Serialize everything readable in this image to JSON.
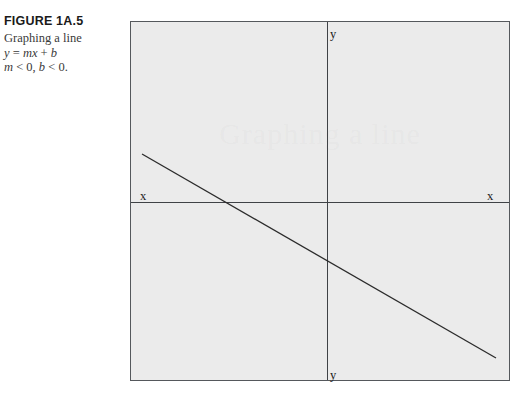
{
  "caption": {
    "figure_number": "FIGURE 1A.5",
    "description": "Graphing a line",
    "equation_prefix": "y",
    "equation_eq": " = ",
    "equation_m": "m",
    "equation_x": "x",
    "equation_plus": " + ",
    "equation_b": "b",
    "condition_m": "m",
    "condition_m_rest": " < 0, ",
    "condition_b": "b",
    "condition_b_rest": " < 0."
  },
  "graph": {
    "watermark": "Graphing a line",
    "label_y_top": "y",
    "label_y_bottom": "y",
    "label_x_left": "x",
    "label_x_right": "x",
    "panel_background": "#ebebeb",
    "panel_border_color": "#55585c",
    "axis_color": "#3f4246",
    "line_color": "#2b2b2b"
  },
  "chart_data": {
    "type": "line",
    "title": "Graphing a line",
    "xlabel": "x",
    "ylabel": "y",
    "grid": false,
    "legend": "none",
    "annotations": [
      "y = mx + b",
      "m < 0, b < 0."
    ],
    "axes": {
      "origin_px": {
        "x": 196,
        "y": 180
      },
      "x_axis_y_px": 180,
      "y_axis_x_px": 196
    },
    "series": [
      {
        "name": "y = mx + b",
        "slope_sign": "negative",
        "intercept_sign": "negative",
        "points_px": [
          {
            "x": 11,
            "y": 132
          },
          {
            "x": 365,
            "y": 336
          }
        ],
        "x_intercept_px": 92,
        "y_intercept_px": 247
      }
    ]
  }
}
